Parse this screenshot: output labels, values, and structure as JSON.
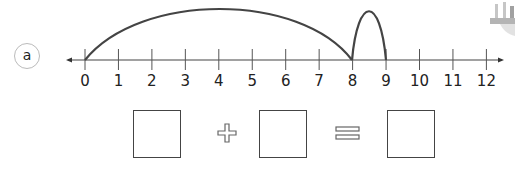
{
  "part_label": "a",
  "number_line": {
    "ticks": [
      "0",
      "1",
      "2",
      "3",
      "4",
      "5",
      "6",
      "7",
      "8",
      "9",
      "10",
      "11",
      "12"
    ],
    "min": 0,
    "max": 12,
    "jumps": [
      {
        "from": 0,
        "to": 8
      },
      {
        "from": 8,
        "to": 9
      }
    ],
    "arc_color": "#444444"
  },
  "equation": {
    "boxes": [
      "",
      "",
      ""
    ],
    "operator": "+",
    "equals": "="
  },
  "decoration": "building-illustration"
}
